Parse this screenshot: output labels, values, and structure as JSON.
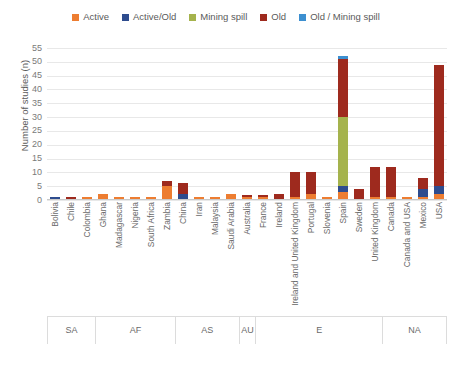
{
  "legend": {
    "items": [
      {
        "label": "Active",
        "color": "#ED7D31",
        "icon": "square-swatch"
      },
      {
        "label": "Active/Old",
        "color": "#2E4C8E",
        "icon": "square-swatch"
      },
      {
        "label": "Mining spill",
        "color": "#A5B34D",
        "icon": "square-swatch"
      },
      {
        "label": "Old",
        "color": "#9E2A1E",
        "icon": "square-swatch"
      },
      {
        "label": "Old / Mining spill",
        "color": "#3C8FD0",
        "icon": "square-swatch"
      }
    ]
  },
  "axes": {
    "y_title": "Number of studies (n)",
    "y_ticks": [
      0,
      5,
      10,
      15,
      20,
      25,
      30,
      35,
      40,
      45,
      50,
      55
    ],
    "y_min": 0,
    "y_max": 55
  },
  "groups": [
    {
      "label": "SA",
      "span": 3
    },
    {
      "label": "AF",
      "span": 5
    },
    {
      "label": "AS",
      "span": 4
    },
    {
      "label": "AU",
      "span": 1
    },
    {
      "label": "E",
      "span": 8
    },
    {
      "label": "NA",
      "span": 4
    }
  ],
  "chart_data": {
    "type": "bar",
    "title": "",
    "xlabel": "",
    "ylabel": "Number of studies (n)",
    "ylim": [
      0,
      55
    ],
    "grid": true,
    "stacked": true,
    "legend_position": "top",
    "categories": [
      "Bolivia",
      "Chile",
      "Colombia",
      "Ghana",
      "Madagascar",
      "Nigeria",
      "South Africa",
      "Zambia",
      "China",
      "Iran",
      "Malaysia",
      "Saudi Arabia",
      "Australia",
      "France",
      "Ireland",
      "Ireland and United Kingdom",
      "Portugal",
      "Slovenia",
      "Spain",
      "Sweden",
      "United Kingdom",
      "Canada",
      "Canada and USA",
      "Mexico",
      "USA"
    ],
    "series": [
      {
        "name": "Active",
        "color": "#ED7D31",
        "values": [
          0,
          0,
          1,
          2,
          1,
          1,
          1,
          5,
          0,
          1,
          1,
          2,
          1,
          1,
          0,
          1,
          2,
          1,
          3,
          0,
          1,
          1,
          1,
          1,
          2
        ]
      },
      {
        "name": "Active/Old",
        "color": "#2E4C8E",
        "values": [
          1,
          0,
          0,
          0,
          0,
          0,
          0,
          0,
          2,
          0,
          0,
          0,
          0,
          0,
          0,
          0,
          0,
          0,
          2,
          0,
          0,
          0,
          0,
          3,
          3
        ]
      },
      {
        "name": "Mining spill",
        "color": "#A5B34D",
        "values": [
          0,
          0,
          0,
          0,
          0,
          0,
          0,
          0,
          0,
          0,
          0,
          0,
          0,
          0,
          0,
          0,
          0,
          0,
          25,
          0,
          0,
          0,
          0,
          0,
          0
        ]
      },
      {
        "name": "Old",
        "color": "#9E2A1E",
        "values": [
          0,
          1,
          0,
          0,
          0,
          0,
          0,
          2,
          4,
          0,
          0,
          0,
          1,
          1,
          2,
          9,
          8,
          0,
          21,
          4,
          11,
          11,
          0,
          4,
          44
        ]
      },
      {
        "name": "Old / Mining spill",
        "color": "#3C8FD0",
        "values": [
          0,
          0,
          0,
          0,
          0,
          0,
          0,
          0,
          0,
          0,
          0,
          0,
          0,
          0,
          0,
          0,
          0,
          0,
          1,
          0,
          0,
          0,
          0,
          0,
          0
        ]
      }
    ]
  }
}
